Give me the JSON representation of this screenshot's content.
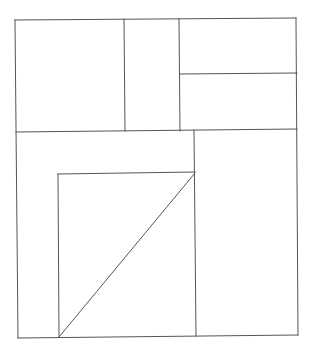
{
  "canvas": {
    "width": 312,
    "height": 352,
    "background": "#ffffff",
    "stroke": "#555555",
    "stroke_width": 1
  },
  "diagram": {
    "labels": [],
    "segments": [
      {
        "id": "outer-top",
        "x1": 15,
        "y1": 20,
        "x2": 296,
        "y2": 18
      },
      {
        "id": "outer-right",
        "x1": 296,
        "y1": 18,
        "x2": 298,
        "y2": 335
      },
      {
        "id": "outer-bottom",
        "x1": 18,
        "y1": 338,
        "x2": 298,
        "y2": 335
      },
      {
        "id": "outer-left",
        "x1": 15,
        "y1": 20,
        "x2": 18,
        "y2": 338
      },
      {
        "id": "top-divider-1",
        "x1": 124,
        "y1": 19,
        "x2": 125,
        "y2": 131
      },
      {
        "id": "top-divider-2",
        "x1": 179,
        "y1": 19,
        "x2": 180,
        "y2": 131
      },
      {
        "id": "top-right-split",
        "x1": 180,
        "y1": 74,
        "x2": 297,
        "y2": 73
      },
      {
        "id": "middle-divider",
        "x1": 16,
        "y1": 132,
        "x2": 297,
        "y2": 129
      },
      {
        "id": "lower-vertical",
        "x1": 194,
        "y1": 130,
        "x2": 196,
        "y2": 336
      },
      {
        "id": "inner-square-top",
        "x1": 58,
        "y1": 174,
        "x2": 195,
        "y2": 172
      },
      {
        "id": "inner-square-left",
        "x1": 58,
        "y1": 174,
        "x2": 59,
        "y2": 337
      },
      {
        "id": "inner-diagonal",
        "x1": 59,
        "y1": 337,
        "x2": 195,
        "y2": 173
      }
    ]
  }
}
